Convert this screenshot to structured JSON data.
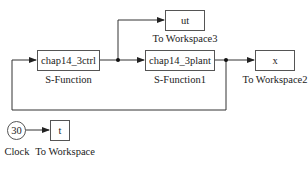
{
  "diagram": {
    "type": "simulink-model",
    "blocks": {
      "ctrl": {
        "text": "chap14_3ctrl",
        "label": "S-Function"
      },
      "plant": {
        "text": "chap14_3plant",
        "label": "S-Function1"
      },
      "ut": {
        "text": "ut",
        "label": "To Workspace3"
      },
      "x": {
        "text": "x",
        "label": "To Workspace2"
      },
      "clock": {
        "text": "30",
        "label": "Clock"
      },
      "t": {
        "text": "t",
        "label": "To Workspace"
      }
    },
    "connections": [
      {
        "from": "S-Function",
        "to": "S-Function1"
      },
      {
        "from": "S-Function",
        "to": "To Workspace3"
      },
      {
        "from": "S-Function1",
        "to": "To Workspace2"
      },
      {
        "from": "S-Function1",
        "to": "S-Function"
      },
      {
        "from": "Clock",
        "to": "To Workspace"
      }
    ],
    "colors": {
      "line": "#333333",
      "block_border": "#555555",
      "background": "#ffffff"
    }
  }
}
